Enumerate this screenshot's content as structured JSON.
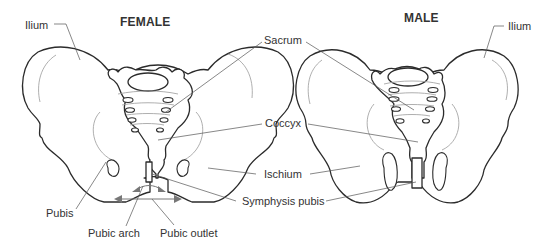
{
  "figure": {
    "panels": [
      {
        "id": "female",
        "title": "FEMALE"
      },
      {
        "id": "male",
        "title": "MALE"
      }
    ],
    "labels": {
      "ilium_left": "Ilium",
      "ilium_right": "Ilium",
      "sacrum": "Sacrum",
      "coccyx": "Coccyx",
      "ischium": "Ischium",
      "symphysis_pubis": "Symphysis pubis",
      "pubis": "Pubis",
      "pubic_arch": "Pubic arch",
      "pubic_outlet": "Pubic outlet"
    },
    "colors": {
      "outline": "#2b2b2b",
      "leader": "#555555",
      "text": "#333333",
      "background": "#ffffff"
    }
  }
}
